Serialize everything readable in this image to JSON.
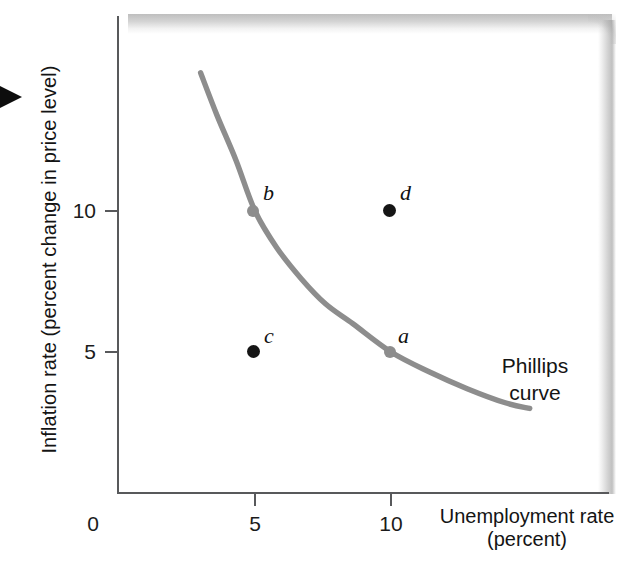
{
  "chart_data": {
    "type": "line",
    "title": "",
    "xlabel": "Unemployment rate",
    "xlabel_line2": "(percent)",
    "ylabel": "Inflation rate (percent change in price level)",
    "xlim": [
      0,
      18
    ],
    "ylim": [
      0,
      17.5
    ],
    "xticks": [
      0,
      5,
      10
    ],
    "xticklabels": [
      "0",
      "5",
      "10"
    ],
    "yticks": [
      5,
      10
    ],
    "yticklabels": [
      "5",
      "10"
    ],
    "grid": false,
    "legend_position": "none",
    "series": [
      {
        "name": "Phillips curve",
        "type": "line",
        "color": "#8d8d8d",
        "x": [
          3.0,
          3.6,
          4.3,
          5.0,
          5.8,
          6.7,
          7.6,
          8.6,
          10.0,
          11.4,
          12.8,
          14.2,
          15.1
        ],
        "y": [
          14.9,
          13.4,
          11.8,
          10.0,
          8.7,
          7.6,
          6.7,
          6.0,
          5.0,
          4.3,
          3.7,
          3.2,
          3.0
        ]
      }
    ],
    "points": [
      {
        "label": "a",
        "x": 10,
        "y": 5,
        "on_curve": true,
        "color": "#8d8d8d"
      },
      {
        "label": "b",
        "x": 5,
        "y": 10,
        "on_curve": true,
        "color": "#8d8d8d"
      },
      {
        "label": "c",
        "x": 5,
        "y": 5,
        "on_curve": false,
        "color": "#151515"
      },
      {
        "label": "d",
        "x": 10,
        "y": 10,
        "on_curve": false,
        "color": "#151515"
      }
    ],
    "annotations": [
      {
        "text": "Phillips",
        "text_line2": "curve",
        "target": "curve"
      }
    ],
    "colors": {
      "curve": "#8d8d8d",
      "axis": "#58595b",
      "point_highlight": "#151515",
      "text": "#141414",
      "shadow": "#9a9a9a"
    }
  },
  "figure": {
    "pointer_icon": "triangle-right-icon"
  }
}
